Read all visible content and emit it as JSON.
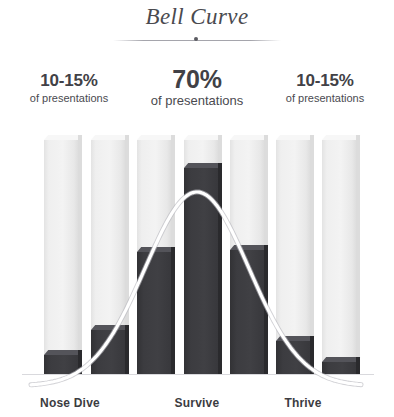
{
  "header": {
    "title": "Bell Curve",
    "divider_icon": "divider-dot"
  },
  "callouts": [
    {
      "pct": "10-15%",
      "sub": "of presentations"
    },
    {
      "pct": "70%",
      "sub": "of presentations"
    },
    {
      "pct": "10-15%",
      "sub": "of presentations"
    }
  ],
  "colors": {
    "bar_fill": "#3c3c40",
    "bar_empty": "#efefef",
    "curve": "#ffffff",
    "curve_edge": "#b9b9bf",
    "text": "#3c3c41",
    "baseline": "#d9d9dd",
    "background": "#ffffff"
  },
  "chart_data": {
    "type": "bar",
    "title": "Bell Curve",
    "xlabel": "",
    "ylabel": "",
    "grid": false,
    "legend": "none",
    "ylim": [
      0,
      100
    ],
    "categories": [
      "1",
      "2",
      "3",
      "4",
      "5",
      "6",
      "7"
    ],
    "category_labels": [
      "Nose Dive",
      "Survive",
      "Thrive"
    ],
    "category_label_positions": [
      1,
      3,
      5
    ],
    "values": [
      8,
      19,
      52,
      88,
      53,
      14,
      5
    ],
    "column_capacity": [
      100,
      100,
      100,
      100,
      100,
      100,
      100
    ],
    "annotations": [
      {
        "text": "10-15% of presentations",
        "region": "left"
      },
      {
        "text": "70% of presentations",
        "region": "center"
      },
      {
        "text": "10-15% of presentations",
        "region": "right"
      }
    ],
    "overlay": {
      "type": "line",
      "name": "bell-curve",
      "description": "normal distribution curve overlaid across the bars"
    }
  }
}
